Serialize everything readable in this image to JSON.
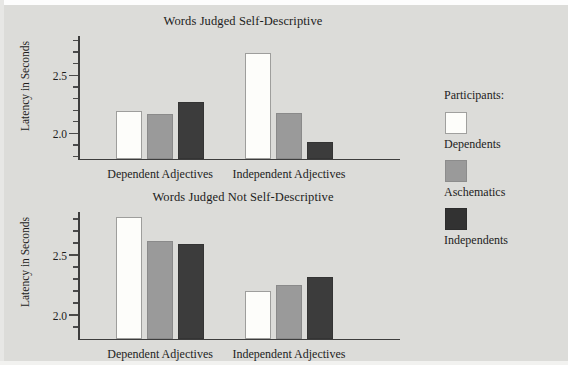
{
  "figure": {
    "background_color": "#dcdcd9",
    "legend": {
      "title": "Participants:",
      "entries": [
        {
          "label": "Dependents",
          "color": "#fdfdfa"
        },
        {
          "label": "Aschematics",
          "color": "#9a9a9a"
        },
        {
          "label": "Independents",
          "color": "#323232"
        }
      ]
    }
  },
  "chart_data": [
    {
      "type": "bar",
      "title": "Words Judged Self-Descriptive",
      "xlabel": "",
      "ylabel": "Latency in Seconds",
      "categories": [
        "Dependent Adjectives",
        "Independent Adjectives"
      ],
      "ylim": [
        1.79,
        2.84
      ],
      "yticks": [
        2.0,
        2.5
      ],
      "ytick_labels": [
        "2.0",
        "2.5"
      ],
      "minor_ticks": true,
      "grid": false,
      "legend_position": "right-outside",
      "series": [
        {
          "name": "Dependents",
          "color": "#fdfdfa",
          "values": [
            2.2,
            2.7
          ]
        },
        {
          "name": "Aschematics",
          "color": "#9a9a9a",
          "values": [
            2.17,
            2.18
          ]
        },
        {
          "name": "Independents",
          "color": "#3c3c3c",
          "values": [
            2.28,
            1.93
          ]
        }
      ]
    },
    {
      "type": "bar",
      "title": "Words Judged Not Self-Descriptive",
      "xlabel": "",
      "ylabel": "Latency in Seconds",
      "categories": [
        "Dependent Adjectives",
        "Independent Adjectives"
      ],
      "ylim": [
        1.81,
        2.86
      ],
      "yticks": [
        2.0,
        2.5
      ],
      "ytick_labels": [
        "2.0",
        "2.5"
      ],
      "minor_ticks": true,
      "grid": false,
      "legend_position": "right-outside",
      "series": [
        {
          "name": "Dependents",
          "color": "#fdfdfa",
          "values": [
            2.82,
            2.21
          ]
        },
        {
          "name": "Aschematics",
          "color": "#9a9a9a",
          "values": [
            2.62,
            2.26
          ]
        },
        {
          "name": "Independents",
          "color": "#3c3c3c",
          "values": [
            2.6,
            2.32
          ]
        }
      ]
    }
  ]
}
